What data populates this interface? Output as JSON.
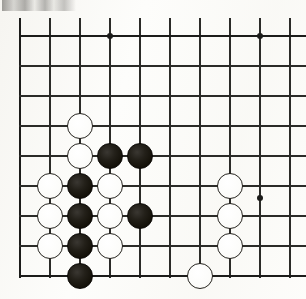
{
  "document": {
    "type": "go-board-diagram",
    "title": "Go board position diagram",
    "description": "Black and white stone position on a partial Go board grid"
  },
  "board": {
    "origin_x": 20,
    "origin_y": 36,
    "spacing": 30,
    "columns": 10,
    "rows": 9,
    "line_color": "#2b2b28",
    "edge_color": "#1c1c1a",
    "background_color": "#fdfdfb",
    "edges": {
      "top": true,
      "left": true,
      "bottom": true,
      "right": false
    },
    "vertical_line_x": [
      20,
      50,
      80,
      110,
      140,
      170,
      200,
      230,
      260,
      290
    ],
    "horizontal_line_y": [
      36,
      66,
      96,
      126,
      156,
      186,
      216,
      246,
      276
    ],
    "star_points": [
      {
        "x": 110,
        "y": 36
      },
      {
        "x": 260,
        "y": 36
      },
      {
        "x": 260,
        "y": 198
      }
    ],
    "star_point_color": "#1c1c1a"
  },
  "stones": {
    "black_color": "#141109",
    "white_color": "#ffffff",
    "white_border_color": "#26241f",
    "diameter": 26,
    "black": [
      {
        "x": 110,
        "y": 156,
        "col": 3,
        "row": 4
      },
      {
        "x": 140,
        "y": 156,
        "col": 4,
        "row": 4
      },
      {
        "x": 80,
        "y": 186,
        "col": 2,
        "row": 5
      },
      {
        "x": 80,
        "y": 216,
        "col": 2,
        "row": 6
      },
      {
        "x": 140,
        "y": 216,
        "col": 4,
        "row": 6
      },
      {
        "x": 80,
        "y": 246,
        "col": 2,
        "row": 7
      },
      {
        "x": 80,
        "y": 276,
        "col": 2,
        "row": 8
      }
    ],
    "white": [
      {
        "x": 80,
        "y": 126,
        "col": 2,
        "row": 3
      },
      {
        "x": 80,
        "y": 156,
        "col": 2,
        "row": 4
      },
      {
        "x": 50,
        "y": 186,
        "col": 1,
        "row": 5
      },
      {
        "x": 110,
        "y": 186,
        "col": 3,
        "row": 5
      },
      {
        "x": 50,
        "y": 216,
        "col": 1,
        "row": 6
      },
      {
        "x": 110,
        "y": 216,
        "col": 3,
        "row": 6
      },
      {
        "x": 50,
        "y": 246,
        "col": 1,
        "row": 7
      },
      {
        "x": 110,
        "y": 246,
        "col": 3,
        "row": 7
      },
      {
        "x": 230,
        "y": 186,
        "col": 7,
        "row": 5
      },
      {
        "x": 230,
        "y": 216,
        "col": 7,
        "row": 6
      },
      {
        "x": 230,
        "y": 246,
        "col": 7,
        "row": 7
      },
      {
        "x": 200,
        "y": 276,
        "col": 6,
        "row": 8
      }
    ],
    "black_count": 7,
    "white_count": 12
  }
}
